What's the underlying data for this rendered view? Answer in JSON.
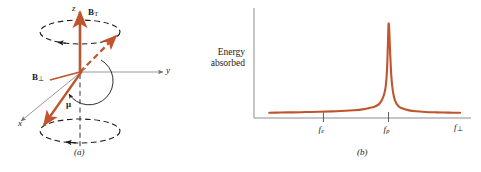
{
  "figure": {
    "background_color": "#ffffff",
    "curve_color": "#c0542c",
    "vector_color": "#c0542c",
    "axis_color": "#8c8c8c",
    "dashed_color": "#1a1a1a",
    "text_color": "#1a1a1a"
  },
  "panel_a": {
    "caption": "(a)",
    "axes": [
      {
        "name": "z-axis-label",
        "label": "z"
      },
      {
        "name": "y-axis-label",
        "label": "y"
      },
      {
        "name": "x-axis-label",
        "label": "x"
      }
    ],
    "vectors": [
      {
        "name": "b-total-vector",
        "symbol": "B",
        "subscript": "T"
      },
      {
        "name": "b-perpendicular-vector",
        "symbol": "B",
        "subscript": "⊥"
      },
      {
        "name": "magnetic-moment-vector",
        "symbol": "μ",
        "subscript": ""
      }
    ],
    "precession_cones": [
      {
        "name": "upper-precession-circle"
      },
      {
        "name": "lower-precession-circle"
      }
    ]
  },
  "panel_b": {
    "caption": "(b)",
    "chart_data": {
      "type": "line",
      "title": "",
      "subtitle": "",
      "xlabel": "f⊥",
      "ylabel": "Energy absorbed",
      "ylabel_lines": [
        "Energy",
        "absorbed"
      ],
      "grid": false,
      "legend": false,
      "xlim": [
        0,
        1
      ],
      "ylim": [
        0,
        1
      ],
      "xticks": [
        0.32,
        0.62
      ],
      "xticklabels": [
        "f_e",
        "f_p"
      ],
      "annotations": [
        {
          "name": "resonance-peak",
          "at_x": 0.62,
          "at_y": 1.0,
          "note": "sharp Lorentzian resonance at f_p"
        }
      ],
      "series": [
        {
          "name": "energy-absorbed-curve",
          "color": "#c0542c",
          "x": [
            0.07,
            0.12,
            0.18,
            0.24,
            0.3,
            0.36,
            0.42,
            0.46,
            0.5,
            0.53,
            0.555,
            0.575,
            0.59,
            0.6,
            0.607,
            0.613,
            0.617,
            0.62,
            0.623,
            0.627,
            0.633,
            0.64,
            0.65,
            0.665,
            0.685,
            0.71,
            0.745,
            0.79,
            0.84,
            0.9,
            0.95
          ],
          "y": [
            0.055,
            0.057,
            0.059,
            0.062,
            0.065,
            0.069,
            0.075,
            0.081,
            0.09,
            0.103,
            0.117,
            0.142,
            0.19,
            0.25,
            0.33,
            0.5,
            0.76,
            0.975,
            0.93,
            0.7,
            0.43,
            0.28,
            0.18,
            0.125,
            0.098,
            0.082,
            0.07,
            0.063,
            0.059,
            0.056,
            0.054
          ]
        }
      ]
    },
    "tick_labels": [
      {
        "name": "tick-label-fe",
        "symbol": "f",
        "subscript": "e"
      },
      {
        "name": "tick-label-fp",
        "symbol": "f",
        "subscript": "p"
      }
    ],
    "x_axis_label": {
      "name": "x-axis-label-f-perp",
      "symbol": "f",
      "subscript": "⊥"
    }
  }
}
